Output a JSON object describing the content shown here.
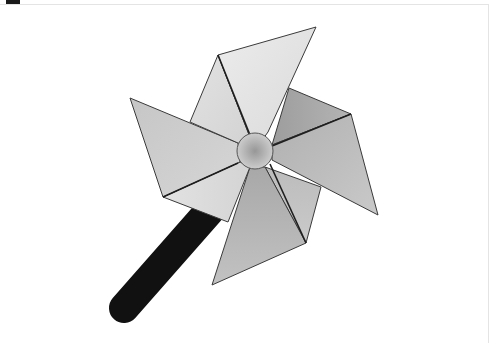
{
  "image": {
    "subject": "pinwheel",
    "description": "Grayscale pinwheel toy with four folded blades, a round center hub, and a black stick handle"
  },
  "colors": {
    "background": "#ffffff",
    "stick": "#111111",
    "outline": "#3a3a3a",
    "fold_line": "#1e1e1e",
    "blade_top_front": "#e6e6e6",
    "blade_top_back": "#dadada",
    "blade_left_front": "#cfcfcf",
    "blade_left_back": "#dedede",
    "blade_right_back": "#a9a9a9",
    "blade_right_front": "#bdbdbd",
    "blade_bottom_front": "#b3b3b3",
    "blade_bottom_back": "#c4c4c4",
    "hub_center": "#9a9a9a",
    "hub_edge": "#cfcfcf",
    "frame_border": "#e4e4e4"
  }
}
